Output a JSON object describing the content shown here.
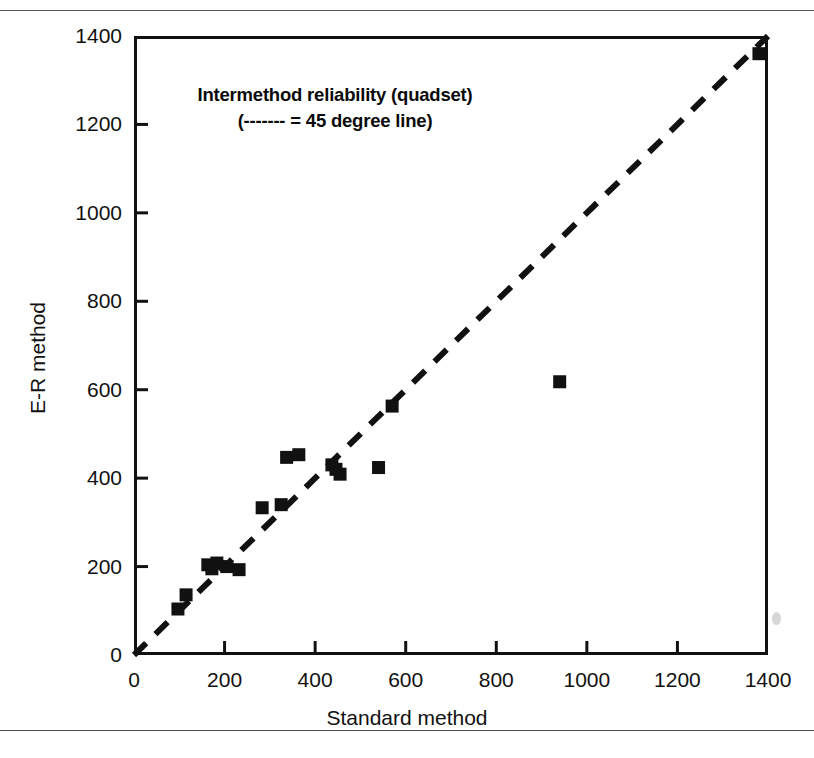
{
  "figure": {
    "annotation_line1": "Intermethod reliability (quadset)",
    "annotation_line2": "(------- = 45 degree line)"
  },
  "chart_data": {
    "type": "scatter",
    "title": "Intermethod reliability (quadset)",
    "subtitle": "(------- = 45 degree line)",
    "xlabel": "Standard method",
    "ylabel": "E-R method",
    "xlim": [
      0,
      1400
    ],
    "ylim": [
      0,
      1400
    ],
    "xticks": [
      0,
      200,
      400,
      600,
      800,
      1000,
      1200,
      1400
    ],
    "yticks": [
      0,
      200,
      400,
      600,
      800,
      1000,
      1200,
      1400
    ],
    "grid": false,
    "legend": "none",
    "marker": "filled-square",
    "marker_color": "#111111",
    "reference_line": {
      "label": "45 degree line",
      "style": "dashed",
      "color": "#111111",
      "from": [
        0,
        0
      ],
      "to": [
        1400,
        1400
      ]
    },
    "points": [
      {
        "x": 97,
        "y": 104
      },
      {
        "x": 115,
        "y": 136
      },
      {
        "x": 163,
        "y": 204
      },
      {
        "x": 172,
        "y": 195
      },
      {
        "x": 183,
        "y": 208
      },
      {
        "x": 205,
        "y": 200
      },
      {
        "x": 232,
        "y": 193
      },
      {
        "x": 283,
        "y": 333
      },
      {
        "x": 325,
        "y": 340
      },
      {
        "x": 337,
        "y": 447
      },
      {
        "x": 364,
        "y": 453
      },
      {
        "x": 437,
        "y": 430
      },
      {
        "x": 446,
        "y": 420
      },
      {
        "x": 455,
        "y": 409
      },
      {
        "x": 540,
        "y": 424
      },
      {
        "x": 570,
        "y": 563
      },
      {
        "x": 940,
        "y": 618
      },
      {
        "x": 1380,
        "y": 1360
      }
    ]
  }
}
